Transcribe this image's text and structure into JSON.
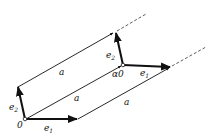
{
  "diagram": {
    "labels": {
      "origin": "0",
      "alpha_origin": "α0",
      "e1": "e",
      "e1_sub": "1",
      "e2": "e",
      "e2_sub": "2",
      "a": "a"
    },
    "colors": {
      "stroke": "#111111",
      "background": "#ffffff"
    }
  }
}
